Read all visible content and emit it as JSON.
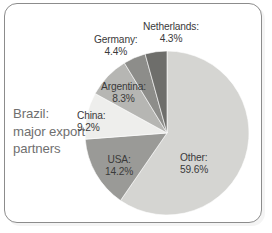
{
  "chart_data": {
    "type": "pie",
    "title": "Brazil: major export partners",
    "title_lines": [
      "Brazil:",
      "major export",
      "partners"
    ],
    "categories": [
      "Other",
      "USA",
      "China",
      "Argentina",
      "Germany",
      "Netherlands"
    ],
    "values": [
      59.6,
      14.2,
      9.2,
      8.3,
      4.4,
      4.3
    ],
    "value_suffix": "%",
    "slices": [
      {
        "name": "Other",
        "value": 59.6,
        "label_name": "Other:",
        "label_value": "59.6%",
        "color": "#d5d5d2",
        "start_deg": 0.0,
        "end_deg": 214.56
      },
      {
        "name": "USA",
        "value": 14.2,
        "label_name": "USA:",
        "label_value": "14.2%",
        "color": "#9a9a97",
        "start_deg": 214.56,
        "end_deg": 265.68
      },
      {
        "name": "China",
        "value": 9.2,
        "label_name": "China:",
        "label_value": "9.2%",
        "color": "#eeeeec",
        "start_deg": 265.68,
        "end_deg": 298.8
      },
      {
        "name": "Argentina",
        "value": 8.3,
        "label_name": "Argentina:",
        "label_value": "8.3%",
        "color": "#b6b6b3",
        "start_deg": 298.8,
        "end_deg": 328.68
      },
      {
        "name": "Germany",
        "value": 4.4,
        "label_name": "Germany:",
        "label_value": "4.4%",
        "color": "#8d8d8a",
        "start_deg": 328.68,
        "end_deg": 344.52
      },
      {
        "name": "Netherlands",
        "value": 4.3,
        "label_name": "Netherlands:",
        "label_value": "4.3%",
        "color": "#6e6e6b",
        "start_deg": 344.52,
        "end_deg": 360.0
      }
    ],
    "legend_position": "inline-labels",
    "grid": false,
    "xlabel": "",
    "ylabel": "",
    "start_angle_deg": 0,
    "direction": "clockwise",
    "total": 100.0,
    "colors": {
      "other": "#d5d5d2",
      "usa": "#9a9a97",
      "china": "#eeeeec",
      "argentina": "#b6b6b3",
      "germany": "#8d8d8a",
      "netherlands": "#6e6e6b",
      "frame_border": "#8c8c8c",
      "title_text": "#6f6f6f",
      "label_text": "#3a3a3a",
      "background": "#ffffff"
    }
  }
}
